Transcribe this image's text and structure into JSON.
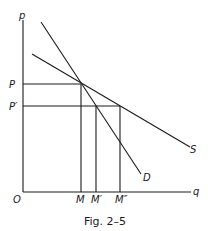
{
  "figure": {
    "caption": "Fig. 2–5",
    "axes": {
      "y_label": "p",
      "x_label": "q",
      "origin_label": "O"
    },
    "price_labels": {
      "p1": "P",
      "p2": "P′"
    },
    "quantity_labels": {
      "m1": "M",
      "m2": "M′",
      "m3": "M″"
    },
    "curves": {
      "supply": "S",
      "demand": "D"
    }
  }
}
